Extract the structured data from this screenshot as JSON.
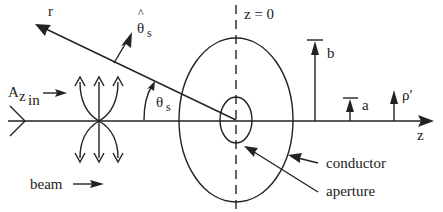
{
  "diagram": {
    "labels": {
      "r": "r",
      "theta_hat": "θ",
      "theta_hat_sub": "s",
      "theta_hat_caret": "^",
      "theta_angle": "θ",
      "theta_angle_sub": "s",
      "z_zero": "z = 0",
      "a_z_in_main": "A",
      "a_z_in_sub1": "z",
      "a_z_in_sub2": "in",
      "beam": "beam",
      "b": "b",
      "a": "a",
      "rho_prime": "ρ′",
      "z_axis": "z",
      "conductor": "conductor",
      "aperture": "aperture"
    },
    "colors": {
      "ink": "#222222",
      "background": "#ffffff"
    }
  }
}
